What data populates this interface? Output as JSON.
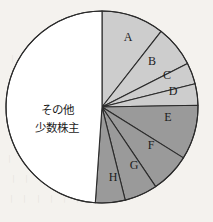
{
  "chart_data": {
    "type": "pie",
    "title": "",
    "subtitle": "",
    "xlabel": "",
    "ylabel": "",
    "legend": "none",
    "grid": false,
    "start_angle_deg": 0,
    "direction": "clockwise",
    "center": {
      "cx": 102,
      "cy": 107,
      "r": 96
    },
    "categories": [
      "A",
      "B",
      "C",
      "D",
      "E",
      "F",
      "G",
      "H",
      "その他\n少数株主"
    ],
    "values": [
      38,
      25,
      13,
      13,
      33,
      24,
      20,
      18,
      176
    ],
    "value_unit": "degrees",
    "slices": [
      {
        "label": "A",
        "angle_deg": 38,
        "start_deg": 0,
        "end_deg": 38,
        "color": "#cdcdcd",
        "label_x": 128,
        "label_y": 38
      },
      {
        "label": "B",
        "angle_deg": 25,
        "start_deg": 38,
        "end_deg": 63,
        "color": "#cdcdcd",
        "label_x": 152,
        "label_y": 62
      },
      {
        "label": "C",
        "angle_deg": 13,
        "start_deg": 63,
        "end_deg": 76,
        "color": "#cdcdcd",
        "label_x": 167,
        "label_y": 76
      },
      {
        "label": "D",
        "angle_deg": 13,
        "start_deg": 76,
        "end_deg": 89,
        "color": "#cdcdcd",
        "label_x": 173,
        "label_y": 92
      },
      {
        "label": "E",
        "angle_deg": 33,
        "start_deg": 89,
        "end_deg": 122,
        "color": "#9a9a9a",
        "label_x": 168,
        "label_y": 118
      },
      {
        "label": "F",
        "angle_deg": 24,
        "start_deg": 122,
        "end_deg": 146,
        "color": "#9a9a9a",
        "label_x": 151,
        "label_y": 146
      },
      {
        "label": "G",
        "angle_deg": 20,
        "start_deg": 146,
        "end_deg": 166,
        "color": "#9a9a9a",
        "label_x": 134,
        "label_y": 166
      },
      {
        "label": "H",
        "angle_deg": 18,
        "start_deg": 166,
        "end_deg": 184,
        "color": "#9a9a9a",
        "label_x": 113,
        "label_y": 178
      },
      {
        "label": "",
        "angle_deg": 176,
        "start_deg": 184,
        "end_deg": 360,
        "color": "#ffffff",
        "label_x": 0,
        "label_y": 0
      }
    ],
    "center_annotation": {
      "line1": "その他",
      "line2": "少数株主",
      "x": 57,
      "y_line1": 110,
      "y_line2": 128
    },
    "colors": {
      "light_slice": "#cdcdcd",
      "dark_slice": "#9a9a9a",
      "other_slice": "#ffffff",
      "outline": "#2b2b2b",
      "background": "#f4f2ee",
      "text": "#1c1c1c"
    },
    "stroke_width": 1.1
  },
  "bleed_through": [
    {
      "text": "︱ ︱ ︱ ︱ ︱",
      "x": 8,
      "y": 52
    },
    {
      "text": "︱ ︱ ︱ ︱ ︱ ︱",
      "x": 6,
      "y": 72
    },
    {
      "text": "︱ ︱ ︱ ︱ ︱",
      "x": 10,
      "y": 92
    },
    {
      "text": "︱ ︱ ︱ ︱ ︱ ︱",
      "x": 5,
      "y": 152
    },
    {
      "text": "︱ ︱ ︱ ︱ ︱",
      "x": 9,
      "y": 172
    },
    {
      "text": "︱ ︱ ︱ ︱ ︱ ︱",
      "x": 7,
      "y": 192
    }
  ]
}
